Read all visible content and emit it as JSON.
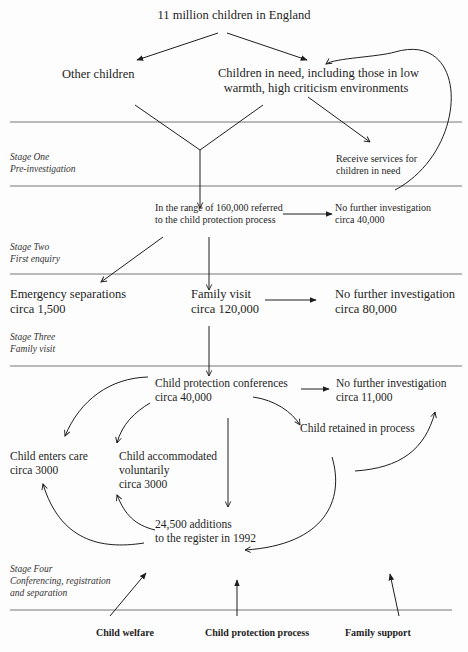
{
  "diagram": {
    "top": "11 million children in England",
    "other_children": "Other children",
    "children_in_need": [
      "Children in need, including those in low",
      "warmth, high criticism environments"
    ],
    "receive_services": [
      "Receive services for",
      "children in need"
    ],
    "referred": [
      "In the range of 160,000 referred",
      "to the child protection process"
    ],
    "nfi_1": [
      "No further investigation",
      "circa 40,000"
    ],
    "emergency": [
      "Emergency separations",
      "circa 1,500"
    ],
    "family_visit": [
      "Family visit",
      "circa 120,000"
    ],
    "nfi_2": [
      "No further investigation",
      "circa 80,000"
    ],
    "conferences": [
      "Child protection conferences",
      "circa 40,000"
    ],
    "nfi_3": [
      "No further investigation",
      "circa 11,000"
    ],
    "retained": "Child retained in process",
    "enters_care": [
      "Child enters care",
      "circa 3000"
    ],
    "accommodated": [
      "Child accommodated",
      "voluntarily",
      "circa 3000"
    ],
    "additions": [
      "24,500 additions",
      "to the register in 1992"
    ]
  },
  "stages": [
    {
      "title": "Stage One",
      "subtitle": [
        "Pre-investigation"
      ]
    },
    {
      "title": "Stage Two",
      "subtitle": [
        "First enquiry"
      ]
    },
    {
      "title": "Stage Three",
      "subtitle": [
        "Family visit"
      ]
    },
    {
      "title": "Stage Four",
      "subtitle": [
        "Conferencing, registration",
        "and separation"
      ]
    }
  ],
  "footer": {
    "child_welfare": "Child welfare",
    "child_protection_process": "Child protection process",
    "family_support": "Family support"
  }
}
